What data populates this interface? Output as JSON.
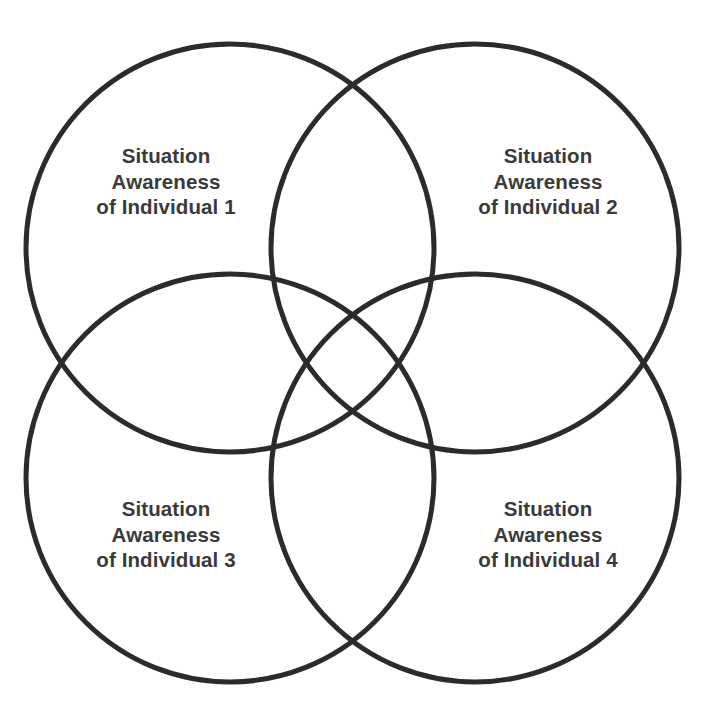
{
  "diagram": {
    "type": "venn",
    "set_count": 4,
    "background_color": "#ffffff",
    "stroke_color": "#2b2b2b",
    "stroke_width": 5,
    "text_color": "#3a3a3a",
    "circles": [
      {
        "id": "circle-top-left",
        "cx": 230,
        "cy": 248,
        "r": 204
      },
      {
        "id": "circle-top-right",
        "cx": 475,
        "cy": 248,
        "r": 204
      },
      {
        "id": "circle-bottom-left",
        "cx": 230,
        "cy": 478,
        "r": 204
      },
      {
        "id": "circle-bottom-right",
        "cx": 475,
        "cy": 478,
        "r": 204
      }
    ],
    "labels": [
      {
        "id": "individual-1",
        "line1": "Situation",
        "line2": "Awareness",
        "line3": "of Individual 1"
      },
      {
        "id": "individual-2",
        "line1": "Situation",
        "line2": "Awareness",
        "line3": "of Individual 2"
      },
      {
        "id": "individual-3",
        "line1": "Situation",
        "line2": "Awareness",
        "line3": "of Individual 3"
      },
      {
        "id": "individual-4",
        "line1": "Situation",
        "line2": "Awareness",
        "line3": "of Individual 4"
      }
    ]
  }
}
